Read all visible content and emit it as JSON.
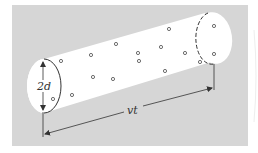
{
  "diagram": {
    "type": "cylinder-collision-volume",
    "labels": {
      "diameter": "2d",
      "length": "vt"
    },
    "colors": {
      "background_panel": "#d6d6d6",
      "cylinder_fill": "#ffffff",
      "stroke": "#333333",
      "page": "#ffffff"
    },
    "molecules": [
      {
        "x": 61,
        "y": 61
      },
      {
        "x": 91,
        "y": 55
      },
      {
        "x": 116,
        "y": 44
      },
      {
        "x": 138,
        "y": 53
      },
      {
        "x": 139,
        "y": 61
      },
      {
        "x": 161,
        "y": 47
      },
      {
        "x": 169,
        "y": 29
      },
      {
        "x": 185,
        "y": 53
      },
      {
        "x": 200,
        "y": 62
      },
      {
        "x": 214,
        "y": 26
      },
      {
        "x": 214,
        "y": 54
      },
      {
        "x": 93,
        "y": 77
      },
      {
        "x": 113,
        "y": 79
      },
      {
        "x": 165,
        "y": 71
      },
      {
        "x": 72,
        "y": 95
      },
      {
        "x": 53,
        "y": 99
      }
    ]
  }
}
